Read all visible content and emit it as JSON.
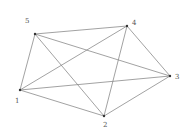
{
  "graph": {
    "type": "complete-graph-K5",
    "edge_color": "#8a8a8a",
    "node_color": "#333333",
    "label_color": "#555555",
    "nodes": [
      {
        "id": "1",
        "label": "1",
        "x": 20,
        "y": 90,
        "lx": 15,
        "ly": 103
      },
      {
        "id": "2",
        "label": "2",
        "x": 104,
        "y": 116,
        "lx": 103,
        "ly": 127
      },
      {
        "id": "3",
        "label": "3",
        "x": 170,
        "y": 76,
        "lx": 175,
        "ly": 79
      },
      {
        "id": "4",
        "label": "4",
        "x": 127,
        "y": 26,
        "lx": 132,
        "ly": 25
      },
      {
        "id": "5",
        "label": "5",
        "x": 35,
        "y": 34,
        "lx": 25,
        "ly": 23
      }
    ],
    "edges": [
      [
        "1",
        "2"
      ],
      [
        "1",
        "3"
      ],
      [
        "1",
        "4"
      ],
      [
        "1",
        "5"
      ],
      [
        "2",
        "3"
      ],
      [
        "2",
        "4"
      ],
      [
        "2",
        "5"
      ],
      [
        "3",
        "4"
      ],
      [
        "3",
        "5"
      ],
      [
        "4",
        "5"
      ]
    ]
  }
}
